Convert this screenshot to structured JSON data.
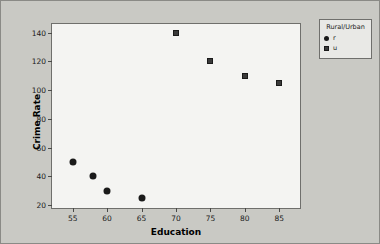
{
  "chart_data": {
    "type": "scatter",
    "title": "",
    "xlabel": "Education",
    "ylabel": "Crime Rate",
    "xlim": [
      52,
      88
    ],
    "ylim": [
      18,
      146
    ],
    "xticks": [
      55,
      60,
      65,
      70,
      75,
      80,
      85
    ],
    "yticks": [
      20,
      40,
      60,
      80,
      100,
      120,
      140
    ],
    "grid": false,
    "legend_position": "right-top",
    "legend_title": "Rural/Urban",
    "series": [
      {
        "name": "r",
        "marker": "circle",
        "color": "#1a1a1a",
        "points": [
          {
            "x": 55,
            "y": 50
          },
          {
            "x": 58,
            "y": 40
          },
          {
            "x": 60,
            "y": 30
          },
          {
            "x": 65,
            "y": 25
          }
        ]
      },
      {
        "name": "u",
        "marker": "square",
        "color": "#3a3a3a",
        "points": [
          {
            "x": 70,
            "y": 140
          },
          {
            "x": 75,
            "y": 120
          },
          {
            "x": 80,
            "y": 110
          },
          {
            "x": 85,
            "y": 105
          }
        ]
      }
    ]
  },
  "colors": {
    "page_background": "#c9c9c4",
    "plot_background": "#f4f4f2",
    "axis": "#6f6f6c",
    "legend_background": "#e9e9e6",
    "text": "#1a1a1a"
  }
}
